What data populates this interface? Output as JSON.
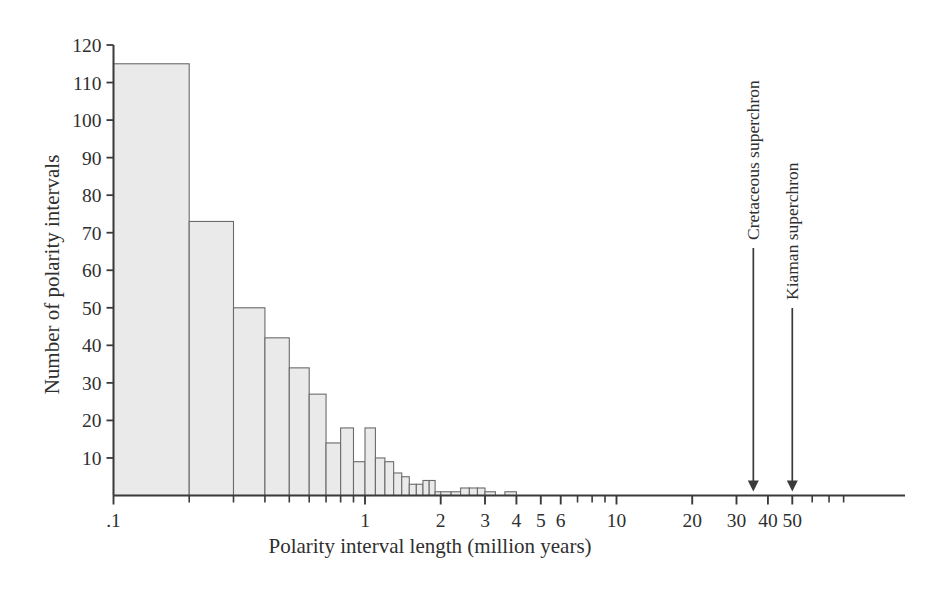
{
  "chart_data": {
    "type": "bar",
    "title": "",
    "xlabel": "Polarity interval length (million years)",
    "ylabel": "Number of polarity intervals",
    "xscale": "log",
    "xlim": [
      0.085,
      90
    ],
    "ylim": [
      0,
      120
    ],
    "grid": false,
    "legend": null,
    "ytick_labels": [
      "10",
      "20",
      "30",
      "40",
      "50",
      "60",
      "70",
      "80",
      "90",
      "100",
      "110",
      "120"
    ],
    "ytick_values": [
      10,
      20,
      30,
      40,
      50,
      60,
      70,
      80,
      90,
      100,
      110,
      120
    ],
    "xtick_labels": [
      ".1",
      "1",
      "2",
      "3",
      "4",
      "5",
      "6",
      "10",
      "20",
      "30",
      "40",
      "50"
    ],
    "xtick_values": [
      0.1,
      1,
      2,
      3,
      4,
      5,
      6,
      10,
      20,
      30,
      40,
      50
    ],
    "xminor_ticks": [
      0.2,
      0.3,
      0.4,
      0.5,
      0.6,
      0.7,
      0.8,
      0.9,
      7,
      8,
      9,
      60,
      70,
      80
    ],
    "bar_edges": [
      0.1,
      0.2,
      0.3,
      0.4,
      0.5,
      0.6,
      0.7,
      0.8,
      0.9,
      1.0,
      1.1,
      1.2,
      1.3,
      1.4,
      1.5,
      1.6,
      1.7,
      1.8,
      1.9,
      2.0,
      2.2,
      2.4,
      2.6,
      2.8,
      3.0,
      3.3,
      3.6,
      4.0
    ],
    "bars": [
      {
        "x0": 0.1,
        "x1": 0.2,
        "value": 115
      },
      {
        "x0": 0.2,
        "x1": 0.3,
        "value": 73
      },
      {
        "x0": 0.3,
        "x1": 0.4,
        "value": 50
      },
      {
        "x0": 0.4,
        "x1": 0.5,
        "value": 42
      },
      {
        "x0": 0.5,
        "x1": 0.6,
        "value": 34
      },
      {
        "x0": 0.6,
        "x1": 0.7,
        "value": 27
      },
      {
        "x0": 0.7,
        "x1": 0.8,
        "value": 14
      },
      {
        "x0": 0.8,
        "x1": 0.9,
        "value": 18
      },
      {
        "x0": 0.9,
        "x1": 1.0,
        "value": 9
      },
      {
        "x0": 1.0,
        "x1": 1.1,
        "value": 18
      },
      {
        "x0": 1.1,
        "x1": 1.2,
        "value": 10
      },
      {
        "x0": 1.2,
        "x1": 1.3,
        "value": 9
      },
      {
        "x0": 1.3,
        "x1": 1.4,
        "value": 6
      },
      {
        "x0": 1.4,
        "x1": 1.5,
        "value": 5
      },
      {
        "x0": 1.5,
        "x1": 1.6,
        "value": 3
      },
      {
        "x0": 1.6,
        "x1": 1.7,
        "value": 3
      },
      {
        "x0": 1.7,
        "x1": 1.8,
        "value": 4
      },
      {
        "x0": 1.8,
        "x1": 1.9,
        "value": 4
      },
      {
        "x0": 1.9,
        "x1": 2.0,
        "value": 1
      },
      {
        "x0": 2.0,
        "x1": 2.2,
        "value": 1
      },
      {
        "x0": 2.2,
        "x1": 2.4,
        "value": 1
      },
      {
        "x0": 2.4,
        "x1": 2.6,
        "value": 2
      },
      {
        "x0": 2.6,
        "x1": 2.8,
        "value": 2
      },
      {
        "x0": 2.8,
        "x1": 3.0,
        "value": 2
      },
      {
        "x0": 3.0,
        "x1": 3.3,
        "value": 1
      },
      {
        "x0": 3.6,
        "x1": 4.0,
        "value": 1
      }
    ],
    "annotations": [
      {
        "label": "Cretaceous superchron",
        "x": 35,
        "arrow": "down"
      },
      {
        "label": "Kiaman superchron",
        "x": 50,
        "arrow": "down"
      }
    ],
    "bar_fill": "#eaeaea",
    "bar_stroke": "#6b6b6b",
    "axis_color": "#3a3a3a"
  }
}
